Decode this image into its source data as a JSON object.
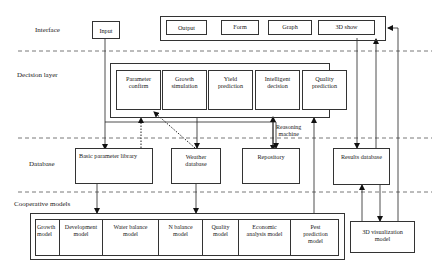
{
  "layers": {
    "interface": "Interface",
    "decision": "Decision layer",
    "database": "Database",
    "cooperative": "Cooperative models"
  },
  "interface": {
    "input": "Input",
    "outputs": [
      "Output",
      "Form",
      "Graph",
      "3D show"
    ]
  },
  "decision": {
    "modules": [
      {
        "line1": "Parameter",
        "line2": "confirm"
      },
      {
        "line1": "Growth",
        "line2": "simulation"
      },
      {
        "line1": "Yield",
        "line2": "prediction"
      },
      {
        "line1": "Intelligent",
        "line2": "decision"
      },
      {
        "line1": "Quality",
        "line2": "prediction"
      }
    ],
    "reasoning_line1": "Reasoning",
    "reasoning_line2": "machine"
  },
  "database": {
    "basic_parameter_library": "Basic parameter library",
    "weather_line1": "Weather",
    "weather_line2": "database",
    "repository": "Repository",
    "results_database": "Results database"
  },
  "cooperative": {
    "models": [
      {
        "line1": "Growth",
        "line2": "model"
      },
      {
        "line1": "Development",
        "line2": "model"
      },
      {
        "line1": "Water balance",
        "line2": "model"
      },
      {
        "line1": "N balance",
        "line2": "model"
      },
      {
        "line1": "Quality",
        "line2": "model"
      },
      {
        "line1": "Economic",
        "line2": "analysis model"
      },
      {
        "line1": "Pest",
        "line2": "prediction",
        "line3": "model"
      }
    ],
    "viz_line1": "3D visualization",
    "viz_line2": "model"
  },
  "colors": {
    "line": "#333333",
    "dash": "#555555",
    "background": "#ffffff"
  }
}
